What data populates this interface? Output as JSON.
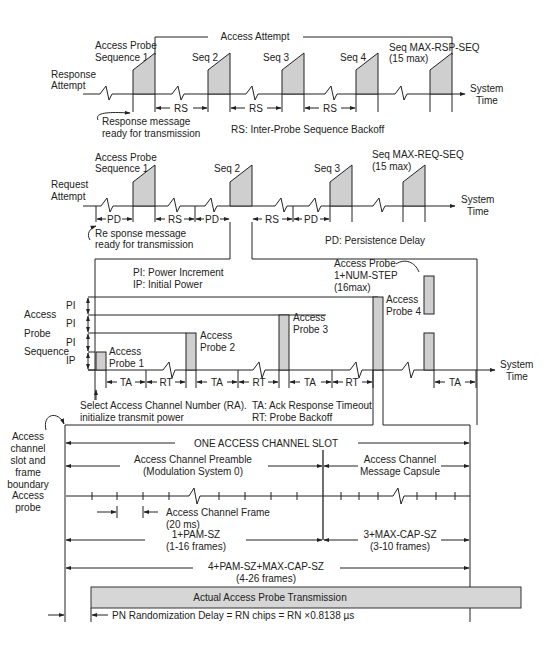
{
  "response_section": {
    "row_label_line1": "Response",
    "row_label_line2": "Attempt",
    "access_attempt_label": "Access Attempt",
    "seq1_line1": "Access Probe",
    "seq1_line2": "Sequence 1",
    "seq2": "Seq 2",
    "seq3": "Seq 3",
    "seq4": "Seq 4",
    "seq_max_line1": "Seq MAX-RSP-SEQ",
    "seq_max_line2": "(15  max)",
    "axis_line1": "System",
    "axis_line2": "Time",
    "gap_label": "RS",
    "ready_line1": "Response message",
    "ready_line2": "ready for transmission",
    "legend": "RS:  Inter-Probe Sequence Backoff"
  },
  "request_section": {
    "row_label_line1": "Request",
    "row_label_line2": "Attempt",
    "seq1_line1": "Access Probe",
    "seq1_line2": "Sequence 1",
    "seq2": "Seq 2",
    "seq3": "Seq 3",
    "seq_max_line1": "Seq MAX-REQ-SEQ",
    "seq_max_line2": "(15  max)",
    "axis_line1": "System",
    "axis_line2": "Time",
    "pd_label": "PD",
    "rs_label": "RS",
    "ready_line1": "Re sponse message",
    "ready_line2": "ready for transmission",
    "legend": "PD:  Persistence Delay"
  },
  "probe_sequence_section": {
    "legend_pi": "PI:  Power Increment",
    "legend_ip": "IP:  Initial Power",
    "row_label_line1": "Access",
    "row_label_line2": "Probe",
    "row_label_line3": "Sequence",
    "power_steps": [
      "PI",
      "PI",
      "PI",
      "IP"
    ],
    "probe1_line1": "Access",
    "probe1_line2": "Probe 1",
    "probe2_line1": "Access",
    "probe2_line2": "Probe 2",
    "probe3_line1": "Access",
    "probe3_line2": "Probe 3",
    "probe4_line1": "Access",
    "probe4_line2": "Probe 4",
    "probe_last_line1": "Access Probe",
    "probe_last_line2": "1+NUM-STEP",
    "probe_last_line3": "(16max)",
    "ta_label": "TA",
    "rt_label": "RT",
    "axis_line1": "System",
    "axis_line2": "Time",
    "select_line1": "Select Access Channel Number (RA).",
    "select_line2": "initialize transmit power",
    "legend_ta": "TA:  Ack Response Timeout",
    "legend_rt": "RT:  Probe Backoff"
  },
  "slot_section": {
    "boundary_line1": "Access",
    "boundary_line2": "channel",
    "boundary_line3": "slot and",
    "boundary_line4": "frame",
    "boundary_line5": "boundary",
    "probe_label_line1": "Access",
    "probe_label_line2": "probe",
    "slot_label": "ONE ACCESS CHANNEL SLOT",
    "preamble_line1": "Access Channel Preamble",
    "preamble_line2": "(Modulation System 0)",
    "capsule_line1": "Access Channel",
    "capsule_line2": "Message Capsule",
    "frame_line1": "Access Channel Frame",
    "frame_line2": "(20  ms)",
    "pam_line1": "1+PAM-SZ",
    "pam_line2": "(1-16 frames)",
    "cap_line1": "3+MAX-CAP-SZ",
    "cap_line2": "(3-10 frames)",
    "total_line1": "4+PAM-SZ+MAX-CAP-SZ",
    "total_line2": "(4-26 frames)",
    "actual_transmission": "Actual Access Probe Transmission",
    "pn_delay": "PN Randomization Delay = RN chips = RN ×0.8138 µs"
  },
  "colors": {
    "line": "#222222",
    "probe_fill": "#cfcfcf",
    "bar_fill": "#d6d6d6",
    "background": "#ffffff"
  }
}
